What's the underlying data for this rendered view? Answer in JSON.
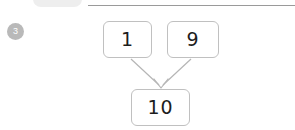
{
  "page": {
    "background_color": "#ffffff",
    "rule_color": "#9a9a9a",
    "box_border_color": "#c0c0c0",
    "arrow_color": "#b5b5b5",
    "ink_color": "#1d1d1d"
  },
  "header": {
    "pill_label": "",
    "pill_color": "#eeeeee"
  },
  "question": {
    "number": "3",
    "badge_color": "#b9b9b9",
    "badge_text_color": "#ffffff"
  },
  "number_bond": {
    "parts": [
      {
        "value": "1",
        "name": "part-a"
      },
      {
        "value": "9",
        "name": "part-b"
      }
    ],
    "whole": {
      "value": "10",
      "name": "whole"
    },
    "arrows": [
      {
        "from": "part-a",
        "to": "whole"
      },
      {
        "from": "part-b",
        "to": "whole"
      }
    ]
  }
}
